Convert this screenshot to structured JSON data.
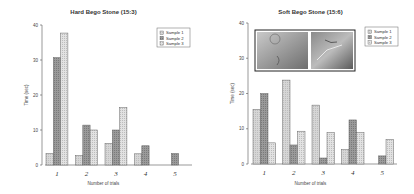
{
  "chart_data": [
    {
      "type": "bar",
      "title": "Hard Bego Stone (15:3)",
      "xlabel": "Number of trials",
      "ylabel": "Time (sec)",
      "ylim": [
        0,
        40
      ],
      "yticks": [
        0,
        10,
        20,
        30,
        40
      ],
      "categories": [
        "1",
        "2",
        "3",
        "4",
        "5"
      ],
      "legend_position": "top-right",
      "grid": false,
      "series": [
        {
          "name": "Sample 1",
          "values": [
            3.3,
            2.7,
            6.2,
            3.2,
            0
          ]
        },
        {
          "name": "Sample 2",
          "values": [
            30.7,
            11.4,
            10.0,
            5.5,
            3.3
          ]
        },
        {
          "name": "Sample 3",
          "values": [
            37.7,
            10.0,
            16.4,
            0,
            0
          ]
        }
      ]
    },
    {
      "type": "bar",
      "title": "Soft Bego Stone (15:6)",
      "xlabel": "Number of trials",
      "ylabel": "Time (sec)",
      "ylim": [
        0,
        40
      ],
      "yticks": [
        0,
        10,
        20,
        30,
        40
      ],
      "categories": [
        "1",
        "2",
        "3",
        "4",
        "5"
      ],
      "legend_position": "top-right",
      "grid": false,
      "inset": "two stone surface photographs",
      "series": [
        {
          "name": "Sample 1",
          "values": [
            15.5,
            23.8,
            16.7,
            4.1,
            0
          ]
        },
        {
          "name": "Sample 2",
          "values": [
            20.0,
            5.4,
            1.7,
            12.5,
            2.3
          ]
        },
        {
          "name": "Sample 3",
          "values": [
            6.0,
            9.3,
            8.9,
            8.9,
            7.0
          ]
        }
      ]
    }
  ],
  "colors": {
    "sample1": "#d6d6d6",
    "sample2": "#9a9a9a",
    "sample3": "#e2e2e2",
    "axis": "#555555"
  }
}
